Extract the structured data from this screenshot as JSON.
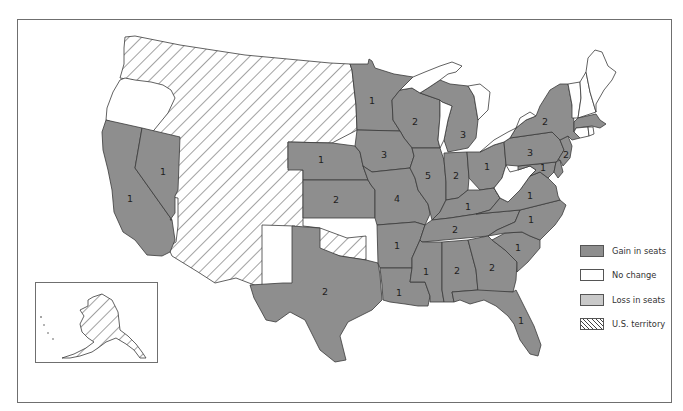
{
  "map": {
    "title": "",
    "colors": {
      "gain": "#8e8e8e",
      "no_change": "#ffffff",
      "loss": "#c9c9c9",
      "territory_hatch": "#444444",
      "border": "#3a3a3a",
      "frame": "#6f6f6f"
    },
    "legend": {
      "items": [
        {
          "key": "gain",
          "label": "Gain in seats"
        },
        {
          "key": "nochange",
          "label": "No change"
        },
        {
          "key": "loss",
          "label": "Loss in seats"
        },
        {
          "key": "terr",
          "label": "U.S. territory"
        }
      ]
    },
    "states": {
      "CA": {
        "status": "gain",
        "seats": "1"
      },
      "NV": {
        "status": "gain",
        "seats": "1"
      },
      "OR": {
        "status": "nochange",
        "seats": ""
      },
      "WEST_TERRITORY": {
        "status": "terr",
        "seats": ""
      },
      "NE": {
        "status": "gain",
        "seats": "1"
      },
      "KS": {
        "status": "gain",
        "seats": "2"
      },
      "TX": {
        "status": "gain",
        "seats": "2"
      },
      "MN": {
        "status": "gain",
        "seats": "1"
      },
      "IA": {
        "status": "gain",
        "seats": "3"
      },
      "MO": {
        "status": "gain",
        "seats": "4"
      },
      "AR": {
        "status": "gain",
        "seats": "1"
      },
      "LA": {
        "status": "gain",
        "seats": "1"
      },
      "WI": {
        "status": "gain",
        "seats": "2"
      },
      "IL": {
        "status": "gain",
        "seats": "5"
      },
      "MI": {
        "status": "gain",
        "seats": "3"
      },
      "IN": {
        "status": "gain",
        "seats": "2"
      },
      "OH": {
        "status": "gain",
        "seats": "1"
      },
      "KY": {
        "status": "gain",
        "seats": "1"
      },
      "TN": {
        "status": "gain",
        "seats": "2"
      },
      "MS": {
        "status": "gain",
        "seats": "1"
      },
      "AL": {
        "status": "gain",
        "seats": "2"
      },
      "GA": {
        "status": "gain",
        "seats": "2"
      },
      "FL": {
        "status": "gain",
        "seats": "1"
      },
      "SC": {
        "status": "gain",
        "seats": "1"
      },
      "NC": {
        "status": "gain",
        "seats": "1"
      },
      "VA": {
        "status": "gain",
        "seats": "1"
      },
      "WV": {
        "status": "nochange",
        "seats": ""
      },
      "MD": {
        "status": "gain",
        "seats": "1"
      },
      "DE": {
        "status": "gain",
        "seats": ""
      },
      "PA": {
        "status": "gain",
        "seats": "3"
      },
      "NJ": {
        "status": "gain",
        "seats": "2"
      },
      "NY": {
        "status": "gain",
        "seats": "2"
      },
      "MA": {
        "status": "gain",
        "seats": ""
      },
      "CT": {
        "status": "nochange",
        "seats": ""
      },
      "RI": {
        "status": "nochange",
        "seats": ""
      },
      "VT": {
        "status": "nochange",
        "seats": ""
      },
      "NH": {
        "status": "nochange",
        "seats": ""
      },
      "ME": {
        "status": "nochange",
        "seats": ""
      },
      "AK": {
        "status": "terr",
        "seats": ""
      }
    }
  }
}
